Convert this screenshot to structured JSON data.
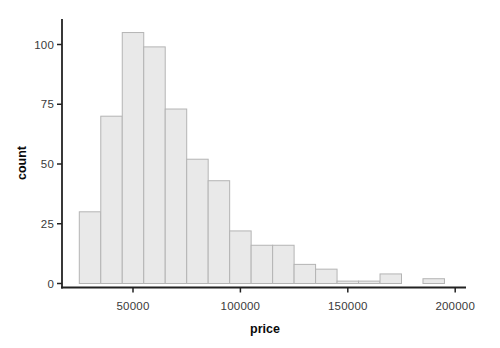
{
  "figure": {
    "width_px": 500,
    "height_px": 348
  },
  "chart_data": {
    "type": "bar",
    "subtype": "histogram",
    "title": "",
    "xlabel": "price",
    "ylabel": "count",
    "bin_start": 25000,
    "bin_width": 10000,
    "counts": [
      30,
      70,
      105,
      99,
      73,
      52,
      43,
      22,
      16,
      16,
      8,
      6,
      1,
      1,
      4,
      0,
      2
    ],
    "x_ticks": [
      50000,
      100000,
      150000,
      200000
    ],
    "x_tick_labels": [
      "50000",
      "100000",
      "150000",
      "200000"
    ],
    "y_ticks": [
      0,
      25,
      50,
      75,
      100
    ],
    "y_tick_labels": [
      "0",
      "25",
      "50",
      "75",
      "100"
    ],
    "xlim": [
      16500,
      203500
    ],
    "ylim": [
      0,
      110
    ],
    "grid": false,
    "legend": false,
    "colors": {
      "bar_fill": "#e9e9e9",
      "bar_border": "#b4b4b4",
      "axis_line": "#222222",
      "tick_label": "#3a3a3a",
      "axis_title": "#0a0a0a",
      "background": "#ffffff"
    }
  }
}
